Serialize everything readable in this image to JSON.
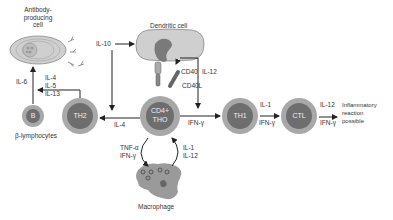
{
  "cells": {
    "antibody_cell": {
      "label": "Antibody-\nproducing\ncell"
    },
    "dendritic_cell": {
      "label": "Dendritic cell"
    },
    "b_cell": {
      "label": "B",
      "caption": "β-lymphocytes"
    },
    "th2": {
      "label": "TH2"
    },
    "cd4_th0": {
      "label_line1": "CD4+",
      "label_line2": "THO"
    },
    "th1": {
      "label": "TH1"
    },
    "ctl": {
      "label": "CTL"
    },
    "macrophage": {
      "label": "Macrophage"
    }
  },
  "labels": {
    "il6": "IL-6",
    "il4_5_13": [
      "IL-4",
      "IL-5",
      "IL-13"
    ],
    "il10": "IL-10",
    "il4": "IL-4",
    "cd40": "CD40",
    "cd40l": "CD40L",
    "il12_dc": "IL-12",
    "ifn_gamma_th0": "IFN-γ",
    "th1_to_ctl": [
      "IL-1",
      "IFN-γ"
    ],
    "ctl_out": [
      "IL-12",
      "IFN-γ"
    ],
    "outcome": [
      "Inflammatory",
      "reaction",
      "possible"
    ],
    "macrophage_in": [
      "TNF-α",
      "IFN-γ"
    ],
    "macrophage_out": [
      "IL-1",
      "IL-12"
    ]
  },
  "colors": {
    "outer_ring": "#a8a8a8",
    "inner_cell": "#6e6e6e",
    "membrane": "#d0d0d0",
    "arrow": "#222222"
  }
}
